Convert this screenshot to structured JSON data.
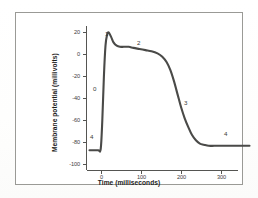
{
  "chart_data": {
    "type": "line",
    "title": "",
    "xlabel": "Time (milliseconds)",
    "ylabel": "Membrane potential (millivolts)",
    "xlim": [
      -30,
      370
    ],
    "ylim": [
      -105,
      28
    ],
    "xticks": [
      0,
      100,
      200,
      300
    ],
    "xticklabels": [
      "0",
      "100",
      "200",
      "300"
    ],
    "yticks": [
      20,
      0,
      -20,
      -40,
      -60,
      -80,
      -100
    ],
    "yticklabels": [
      "20",
      "0",
      "-20",
      "-40",
      "-60",
      "-80",
      "-100"
    ],
    "grid": false,
    "legend": false,
    "series": [
      {
        "name": "Cardiac ventricular action potential",
        "color": "#4a4a48",
        "x": [
          -30,
          -18,
          -8,
          -2,
          2,
          6,
          10,
          14,
          18,
          24,
          30,
          38,
          46,
          56,
          68,
          80,
          95,
          110,
          125,
          140,
          152,
          163,
          172,
          181,
          190,
          199,
          208,
          217,
          226,
          236,
          246,
          256,
          268,
          282,
          300,
          320,
          345,
          370
        ],
        "y": [
          -87,
          -87,
          -87,
          -86,
          -60,
          -20,
          8,
          18,
          20,
          16,
          11,
          8,
          7,
          7,
          7,
          6,
          5,
          4,
          3,
          1,
          -2,
          -7,
          -14,
          -24,
          -36,
          -48,
          -58,
          -66,
          -73,
          -78,
          -81,
          -82,
          -83,
          -83,
          -83,
          -83,
          -83,
          -83
        ]
      }
    ],
    "annotations": [
      {
        "label": "0",
        "x": 0,
        "y": -40,
        "note": "phase-0-upstroke"
      },
      {
        "label": "1",
        "x": 16,
        "y": 26,
        "note": "phase-1-initial-repolarization"
      },
      {
        "label": "2",
        "x": 98,
        "y": 14,
        "note": "phase-2-plateau"
      },
      {
        "label": "3",
        "x": 214,
        "y": -44,
        "note": "phase-3-repolarization"
      },
      {
        "label": "4",
        "x": -22,
        "y": -78,
        "note": "phase-4-resting-left"
      },
      {
        "label": "4",
        "x": 318,
        "y": -75,
        "note": "phase-4-resting-right"
      }
    ]
  },
  "figure": {
    "frame_color": "#9a9a96",
    "axis_color": "#555552",
    "curve_color": "#4a4a48",
    "background": "#ffffff"
  }
}
